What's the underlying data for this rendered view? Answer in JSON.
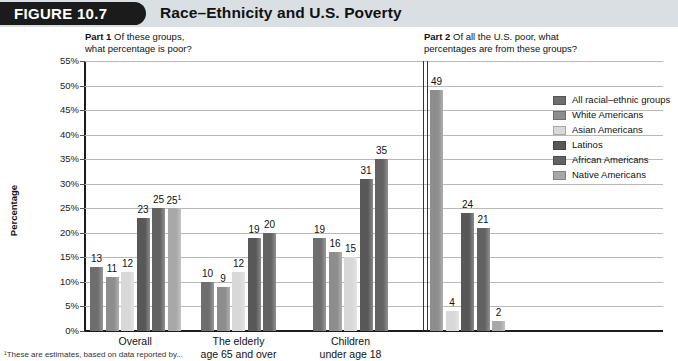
{
  "figure": {
    "tab_label": "FIGURE 10.7",
    "title": "Race–Ethnicity and U.S. Poverty"
  },
  "parts": {
    "part1": {
      "label": "Part 1",
      "question_line1": "Of these groups,",
      "question_line2": "what percentage is poor?"
    },
    "part2": {
      "label": "Part 2",
      "question_line1": "Of all the U.S. poor, what",
      "question_line2": "percentages are from these groups?"
    }
  },
  "legend": {
    "items": [
      {
        "label": "All racial–ethnic groups",
        "color": "#6e6e6e"
      },
      {
        "label": "White Americans",
        "color": "#8d8d8d"
      },
      {
        "label": "Asian Americans",
        "color": "#d8d8d8"
      },
      {
        "label": "Latinos",
        "color": "#585858"
      },
      {
        "label": "African Americans",
        "color": "#626262"
      },
      {
        "label": "Native Americans",
        "color": "#a8a8a8"
      }
    ]
  },
  "footnote": "¹These are estimates, based on data reported by...",
  "chart_data": {
    "type": "bar",
    "title": "Race–Ethnicity and U.S. Poverty",
    "xlabel": "",
    "ylabel": "Percentage",
    "ylim": [
      0,
      55
    ],
    "ytick_labels": [
      "0%",
      "5%",
      "10%",
      "15%",
      "20%",
      "25%",
      "30%",
      "35%",
      "40%",
      "45%",
      "50%",
      "55%"
    ],
    "ytick_values": [
      0,
      5,
      10,
      15,
      20,
      25,
      30,
      35,
      40,
      45,
      50,
      55
    ],
    "grid": true,
    "legend_position": "right",
    "series": [
      {
        "name": "All racial–ethnic groups",
        "color": "#6e6e6e"
      },
      {
        "name": "White Americans",
        "color": "#8d8d8d"
      },
      {
        "name": "Asian Americans",
        "color": "#d8d8d8"
      },
      {
        "name": "Latinos",
        "color": "#585858"
      },
      {
        "name": "African Americans",
        "color": "#626262"
      },
      {
        "name": "Native Americans",
        "color": "#a8a8a8"
      }
    ],
    "groups": [
      {
        "part": 1,
        "category": "Overall",
        "category_lines": [
          "Overall"
        ],
        "bars": [
          {
            "series": "All racial–ethnic groups",
            "value": 13,
            "label": "13",
            "color": "#6e6e6e"
          },
          {
            "series": "White Americans",
            "value": 11,
            "label": "11",
            "color": "#8d8d8d"
          },
          {
            "series": "Asian Americans",
            "value": 12,
            "label": "12",
            "color": "#d8d8d8"
          },
          {
            "series": "Latinos",
            "value": 23,
            "label": "23",
            "color": "#585858"
          },
          {
            "series": "African Americans",
            "value": 25,
            "label": "25",
            "color": "#626262"
          },
          {
            "series": "Native Americans",
            "value": 25,
            "label": "25",
            "superscript": "1",
            "color": "#a8a8a8"
          }
        ]
      },
      {
        "part": 1,
        "category": "The elderly age 65 and over",
        "category_lines": [
          "The elderly",
          "age 65 and over"
        ],
        "bars": [
          {
            "series": "All racial–ethnic groups",
            "value": 10,
            "label": "10",
            "color": "#6e6e6e"
          },
          {
            "series": "White Americans",
            "value": 9,
            "label": "9",
            "color": "#8d8d8d"
          },
          {
            "series": "Asian Americans",
            "value": 12,
            "label": "12",
            "color": "#d8d8d8"
          },
          {
            "series": "Latinos",
            "value": 19,
            "label": "19",
            "color": "#585858"
          },
          {
            "series": "African Americans",
            "value": 20,
            "label": "20",
            "color": "#626262"
          },
          {
            "series": "Native Americans",
            "value": null,
            "label": "",
            "color": "#a8a8a8"
          }
        ]
      },
      {
        "part": 1,
        "category": "Children under age 18",
        "category_lines": [
          "Children",
          "under age 18"
        ],
        "bars": [
          {
            "series": "All racial–ethnic groups",
            "value": 19,
            "label": "19",
            "color": "#6e6e6e"
          },
          {
            "series": "White Americans",
            "value": 16,
            "label": "16",
            "color": "#8d8d8d"
          },
          {
            "series": "Asian Americans",
            "value": 15,
            "label": "15",
            "color": "#d8d8d8"
          },
          {
            "series": "Latinos",
            "value": 31,
            "label": "31",
            "color": "#585858"
          },
          {
            "series": "African Americans",
            "value": 35,
            "label": "35",
            "color": "#626262"
          },
          {
            "series": "Native Americans",
            "value": null,
            "label": "",
            "color": "#a8a8a8"
          }
        ]
      },
      {
        "part": 2,
        "category": "",
        "category_lines": [],
        "bars": [
          {
            "series": "White Americans",
            "value": 49,
            "label": "49",
            "color": "#8d8d8d"
          },
          {
            "series": "Asian Americans",
            "value": 4,
            "label": "4",
            "color": "#d8d8d8"
          },
          {
            "series": "Latinos",
            "value": 24,
            "label": "24",
            "color": "#585858"
          },
          {
            "series": "African Americans",
            "value": 21,
            "label": "21",
            "color": "#626262"
          },
          {
            "series": "Native Americans",
            "value": 2,
            "label": "2",
            "color": "#a8a8a8"
          }
        ]
      }
    ]
  }
}
